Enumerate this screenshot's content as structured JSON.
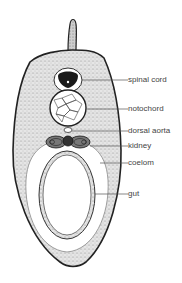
{
  "diagram": {
    "labels": [
      {
        "id": "spinal-cord",
        "text": "spinal cord",
        "y": 75
      },
      {
        "id": "notochord",
        "text": "notochord",
        "y": 104
      },
      {
        "id": "dorsal-aorta",
        "text": "dorsal aorta",
        "y": 126
      },
      {
        "id": "kidney",
        "text": "kidney",
        "y": 141
      },
      {
        "id": "coelom",
        "text": "coelom",
        "y": 158
      },
      {
        "id": "gut",
        "text": "gut",
        "y": 189
      }
    ],
    "colors": {
      "tissue": "#d9d9d9",
      "outline": "#222222",
      "leader": "#555555",
      "text": "#444444"
    }
  }
}
